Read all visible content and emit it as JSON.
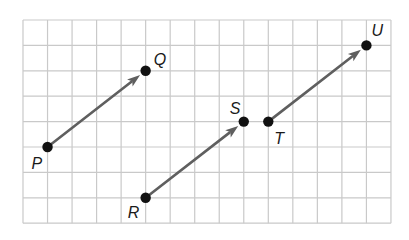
{
  "grid": {
    "origin_x": 23,
    "origin_y": 20,
    "cols": 15,
    "rows": 8,
    "cell_w": 24.53,
    "cell_h": 25.4,
    "line_color": "#c9c9c9"
  },
  "colors": {
    "vector": "#5f5f5f",
    "point": "#111111"
  },
  "points": [
    {
      "label": "P",
      "gx": 1,
      "gy": 5,
      "label_dx": -16,
      "label_dy": 22
    },
    {
      "label": "Q",
      "gx": 5,
      "gy": 2,
      "label_dx": 8,
      "label_dy": -6
    },
    {
      "label": "R",
      "gx": 5,
      "gy": 7,
      "label_dx": -18,
      "label_dy": 20
    },
    {
      "label": "S",
      "gx": 9,
      "gy": 4,
      "label_dx": -14,
      "label_dy": -8
    },
    {
      "label": "T",
      "gx": 10,
      "gy": 4,
      "label_dx": 6,
      "label_dy": 22
    },
    {
      "label": "U",
      "gx": 14,
      "gy": 1,
      "label_dx": 5,
      "label_dy": -9
    }
  ],
  "vectors": [
    {
      "name": "PQ",
      "from": "P",
      "to": "Q"
    },
    {
      "name": "RS",
      "from": "R",
      "to": "S"
    },
    {
      "name": "TU",
      "from": "T",
      "to": "U"
    }
  ],
  "labels": {
    "P": "P",
    "Q": "Q",
    "R": "R",
    "S": "S",
    "T": "T",
    "U": "U"
  }
}
